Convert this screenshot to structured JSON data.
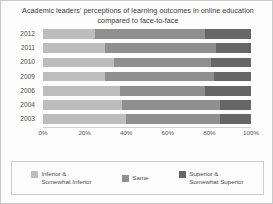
{
  "chart_data": {
    "type": "bar",
    "title": "Academic leaders' perceptions of learning outcomes in online education compared to face-to-face",
    "orientation": "horizontal",
    "stacked": true,
    "xlabel": "",
    "ylabel": "",
    "xlim": [
      0,
      100
    ],
    "grid": false,
    "legend_position": "bottom",
    "categories": [
      "2012",
      "2011",
      "2010",
      "2009",
      "2006",
      "2004",
      "2003"
    ],
    "tick_labels": [
      "0%",
      "20%",
      "40%",
      "60%",
      "80%",
      "100%"
    ],
    "tick_values": [
      0,
      20,
      40,
      60,
      80,
      100
    ],
    "series": [
      {
        "name": "Inferior & Somewhat Inferior",
        "color": "#bdbdbd",
        "values": [
          25,
          30,
          34,
          30,
          37,
          38,
          40
        ]
      },
      {
        "name": "Same",
        "color": "#8f8f8f",
        "values": [
          53,
          53,
          47,
          52,
          41,
          47,
          45
        ]
      },
      {
        "name": "Superior & Somewhat Superior",
        "color": "#666666",
        "values": [
          22,
          17,
          19,
          18,
          22,
          15,
          15
        ]
      }
    ]
  },
  "legend": {
    "items": [
      {
        "label": "Inferior &\nSomewhat Inferior",
        "color": "#bdbdbd"
      },
      {
        "label": "Same",
        "color": "#8f8f8f"
      },
      {
        "label": "Superior &\nSomewhat Superior",
        "color": "#666666"
      }
    ]
  }
}
